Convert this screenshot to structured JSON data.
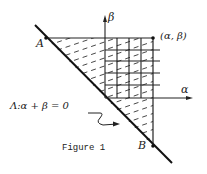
{
  "figure": {
    "caption": "Figure 1",
    "labels": {
      "point_a": "A",
      "point_b": "B",
      "corner_point": "(α, β)",
      "alpha_axis": "α",
      "beta_axis": "β",
      "line_equation": "Λ:α + β = 0"
    },
    "colors": {
      "ink": "#222222",
      "background": "#ffffff"
    }
  }
}
